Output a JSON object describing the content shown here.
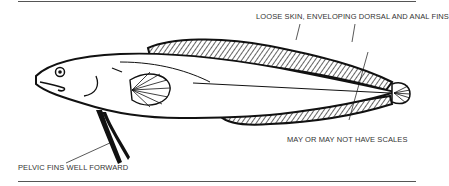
{
  "figure": {
    "labels": {
      "top": "LOOSE SKIN, ENVELOPING DORSAL AND ANAL FINS",
      "right": "MAY OR MAY NOT HAVE SCALES",
      "bottom_left": "PELVIC FINS WELL FORWARD"
    }
  }
}
